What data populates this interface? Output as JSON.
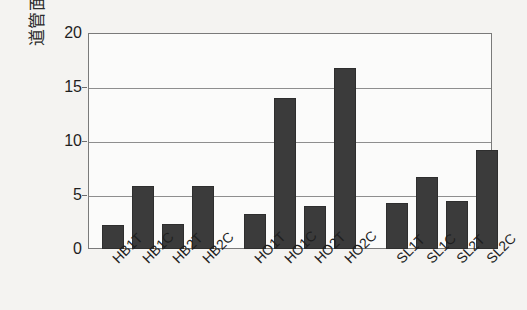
{
  "chart_data": {
    "type": "bar",
    "title": "",
    "xlabel": "",
    "ylabel": "道管面積率 (%)",
    "ylim": [
      0,
      20
    ],
    "yticks": [
      0,
      5,
      10,
      15,
      20
    ],
    "ytick_labels": [
      "0",
      "5",
      "10",
      "15",
      "20"
    ],
    "grid": true,
    "legend": "none",
    "categories": [
      "HB1T",
      "HB1C",
      "HB2T",
      "HB2C",
      "HO1T",
      "HO1C",
      "HO2T",
      "HO2C",
      "SL1T",
      "SL1C",
      "SL2T",
      "SL2C"
    ],
    "values": [
      2.2,
      5.8,
      2.3,
      5.8,
      3.2,
      14.0,
      4.0,
      16.8,
      4.3,
      6.7,
      4.4,
      9.2
    ],
    "groups": [
      {
        "name": "HB",
        "categories": [
          "HB1T",
          "HB1C",
          "HB2T",
          "HB2C"
        ]
      },
      {
        "name": "HO",
        "categories": [
          "HO1T",
          "HO1C",
          "HO2T",
          "HO2C"
        ]
      },
      {
        "name": "SL",
        "categories": [
          "SL1T",
          "SL1C",
          "SL2T",
          "SL2C"
        ]
      }
    ],
    "bar_color": "#3b3b3b",
    "background_color": "#f4f3f1",
    "plot_background_color": "#fbfbfa",
    "axis_color": "#7a7a7a"
  },
  "axis": {
    "y_title": "道管面積率 (%)",
    "y_tick_0": "0",
    "y_tick_5": "5",
    "y_tick_10": "10",
    "y_tick_15": "15",
    "y_tick_20": "20"
  },
  "x_labels": {
    "l0": "HB1T",
    "l1": "HB1C",
    "l2": "HB2T",
    "l3": "HB2C",
    "l4": "HO1T",
    "l5": "HO1C",
    "l6": "HO2T",
    "l7": "HO2C",
    "l8": "SL1T",
    "l9": "SL1C",
    "l10": "SL2T",
    "l11": "SL2C"
  }
}
